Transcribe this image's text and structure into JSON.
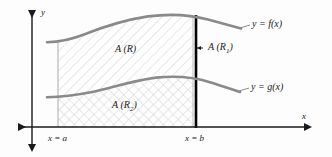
{
  "figure": {
    "type": "calculus-area-between-curves-diagram",
    "background_color": "#fdfdfd",
    "axes": {
      "x_axis_label": "x",
      "y_axis_label": "y",
      "axis_color": "#1a1a1a",
      "x_axis_y_px": 127,
      "y_axis_x_px": 32
    },
    "curves": {
      "upper": {
        "label": "y = f(x)",
        "color": "#8a8a8a",
        "points": [
          [
            48,
            42
          ],
          [
            62,
            41
          ],
          [
            78,
            37
          ],
          [
            96,
            29
          ],
          [
            118,
            22
          ],
          [
            144,
            17
          ],
          [
            168,
            15
          ],
          [
            192,
            16
          ],
          [
            214,
            21
          ],
          [
            238,
            28
          ]
        ]
      },
      "lower": {
        "label": "y = g(x)",
        "color": "#8a8a8a",
        "points": [
          [
            48,
            97
          ],
          [
            64,
            96
          ],
          [
            82,
            94
          ],
          [
            100,
            90
          ],
          [
            120,
            85
          ],
          [
            142,
            80
          ],
          [
            166,
            77
          ],
          [
            190,
            77
          ],
          [
            212,
            82
          ],
          [
            236,
            91
          ]
        ]
      }
    },
    "regions": {
      "upper_region_label": "A (R)",
      "upper_region_sub": "",
      "lower_region_label": "A (R",
      "lower_region_sub": "2",
      "lower_region_label_end": ")",
      "slice_label": "A (R",
      "slice_sub": "1",
      "slice_label_end": ")"
    },
    "boundaries": {
      "left_label": "x = a",
      "right_label": "x = b",
      "left_x_px": 58,
      "right_x_px": 195,
      "left_line_color": "#bdbdbd",
      "right_line_color": "#000000"
    },
    "hatch": {
      "upper_pattern": "diagonal",
      "lower_pattern": "cross",
      "color": "#c9c9c9"
    }
  }
}
